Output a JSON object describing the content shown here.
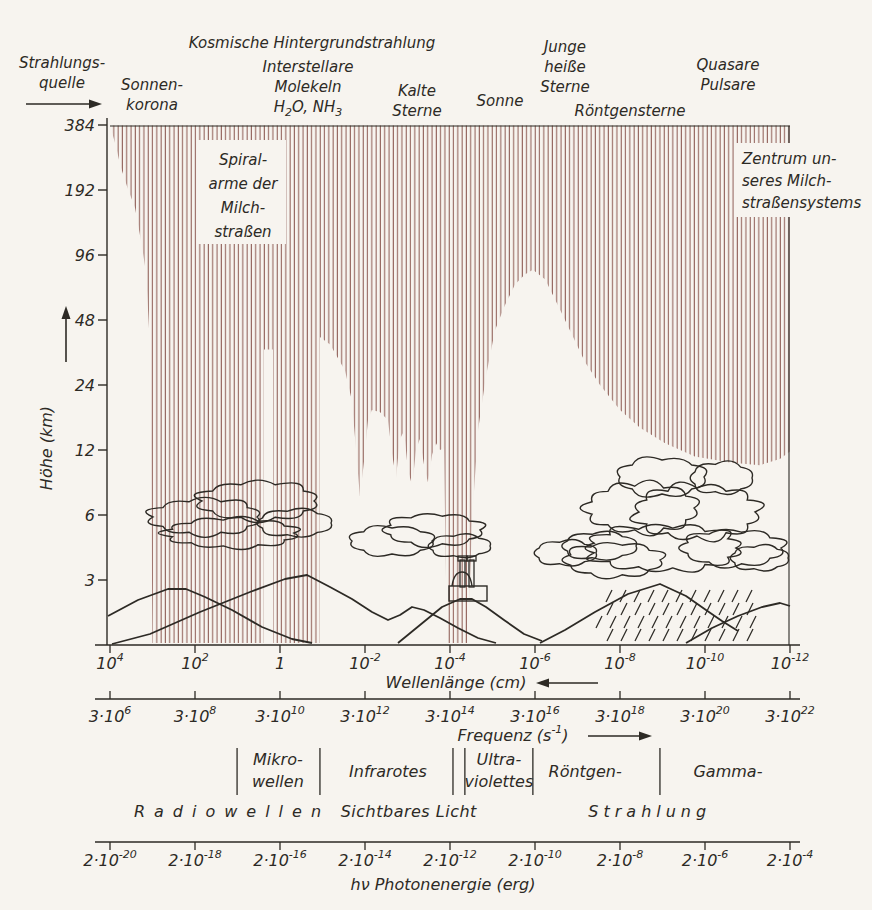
{
  "figure": {
    "width": 872,
    "height": 910,
    "colors": {
      "paper": "#f7f4ef",
      "ink": "#2d2a25",
      "hatch": "#8a564e"
    },
    "sources_heading": {
      "x": 62,
      "y": 68,
      "lines": [
        [
          {
            "t": "Strahlungs-"
          }
        ],
        [
          {
            "t": "quelle"
          }
        ]
      ],
      "arrow": {
        "x1": 26,
        "y1": 104,
        "x2": 102,
        "y2": 104
      }
    },
    "sources": [
      {
        "x": 152,
        "y": 90,
        "lines": [
          [
            {
              "t": "Sonnen-"
            }
          ],
          [
            {
              "t": "korona"
            }
          ]
        ]
      },
      {
        "x": 312,
        "y": 48,
        "lines": [
          [
            {
              "t": "Kosmische Hintergrundstrahlung"
            }
          ]
        ]
      },
      {
        "x": 308,
        "y": 72,
        "lines": [
          [
            {
              "t": "Interstellare"
            }
          ],
          [
            {
              "t": "Molekeln"
            }
          ],
          [
            {
              "t": "H"
            },
            {
              "t": "2",
              "sub": true
            },
            {
              "t": "O, NH"
            },
            {
              "t": "3",
              "sub": true
            }
          ]
        ]
      },
      {
        "x": 417,
        "y": 96,
        "lines": [
          [
            {
              "t": "Kalte"
            }
          ],
          [
            {
              "t": "Sterne"
            }
          ]
        ]
      },
      {
        "x": 500,
        "y": 106,
        "lines": [
          [
            {
              "t": "Sonne"
            }
          ]
        ]
      },
      {
        "x": 565,
        "y": 52,
        "lines": [
          [
            {
              "t": "Junge"
            }
          ],
          [
            {
              "t": "heiße"
            }
          ],
          [
            {
              "t": "Sterne"
            }
          ]
        ]
      },
      {
        "x": 630,
        "y": 116,
        "lines": [
          [
            {
              "t": "Röntgensterne"
            }
          ]
        ]
      },
      {
        "x": 728,
        "y": 70,
        "lines": [
          [
            {
              "t": "Quasare"
            }
          ],
          [
            {
              "t": "Pulsare"
            }
          ]
        ]
      }
    ],
    "annotations": [
      {
        "name": "spiral-arms",
        "anchor": "middle",
        "x": 243,
        "y": 165,
        "lh": 24,
        "box": [
          198,
          140,
          88,
          104
        ],
        "lines": [
          [
            {
              "t": "Spiral-"
            }
          ],
          [
            {
              "t": "arme der"
            }
          ],
          [
            {
              "t": "Milch-"
            }
          ],
          [
            {
              "t": "straßen"
            }
          ]
        ]
      },
      {
        "name": "galactic-center",
        "anchor": "start",
        "x": 742,
        "y": 164,
        "lh": 22,
        "box": [
          736,
          143,
          126,
          74
        ],
        "lines": [
          [
            {
              "t": "Zentrum un-"
            }
          ],
          [
            {
              "t": "seres Milch-"
            }
          ],
          [
            {
              "t": "straßensystems"
            }
          ]
        ]
      }
    ],
    "scenery": {
      "mountains": [
        [
          [
            108,
            616
          ],
          [
            138,
            600
          ],
          [
            168,
            589
          ],
          [
            186,
            589
          ],
          [
            205,
            597
          ],
          [
            232,
            610
          ],
          [
            262,
            627
          ],
          [
            292,
            639
          ],
          [
            312,
            643
          ]
        ],
        [
          [
            112,
            644
          ],
          [
            150,
            634
          ],
          [
            200,
            612
          ],
          [
            250,
            592
          ],
          [
            285,
            579
          ],
          [
            307,
            575
          ],
          [
            330,
            587
          ],
          [
            352,
            599
          ],
          [
            372,
            612
          ],
          [
            388,
            620
          ],
          [
            400,
            615
          ],
          [
            412,
            607
          ],
          [
            424,
            610
          ],
          [
            440,
            618
          ],
          [
            458,
            628
          ],
          [
            478,
            638
          ],
          [
            496,
            643
          ]
        ],
        [
          [
            398,
            643
          ],
          [
            420,
            625
          ],
          [
            442,
            607
          ],
          [
            460,
            599
          ],
          [
            472,
            599
          ],
          [
            486,
            607
          ],
          [
            504,
            620
          ],
          [
            524,
            634
          ],
          [
            542,
            641
          ]
        ],
        [
          [
            540,
            643
          ],
          [
            565,
            630
          ],
          [
            595,
            612
          ],
          [
            628,
            594
          ],
          [
            660,
            584
          ],
          [
            686,
            596
          ],
          [
            706,
            610
          ],
          [
            722,
            621
          ],
          [
            738,
            631
          ]
        ],
        [
          [
            686,
            643
          ],
          [
            712,
            628
          ],
          [
            738,
            616
          ],
          [
            762,
            607
          ],
          [
            780,
            603
          ],
          [
            790,
            606
          ]
        ]
      ],
      "clouds": [
        [
          205,
          517,
          52,
          16
        ],
        [
          258,
          501,
          56,
          17
        ],
        [
          232,
          533,
          62,
          13
        ],
        [
          295,
          523,
          36,
          12
        ],
        [
          392,
          541,
          40,
          13
        ],
        [
          434,
          530,
          46,
          14
        ],
        [
          460,
          546,
          30,
          10
        ],
        [
          566,
          553,
          30,
          11
        ],
        [
          600,
          546,
          36,
          12
        ],
        [
          614,
          560,
          46,
          15
        ],
        [
          664,
          548,
          72,
          20
        ],
        [
          642,
          508,
          52,
          22
        ],
        [
          697,
          512,
          58,
          24
        ],
        [
          662,
          477,
          42,
          17
        ],
        [
          722,
          478,
          30,
          14
        ],
        [
          733,
          548,
          48,
          16
        ],
        [
          760,
          558,
          28,
          11
        ]
      ],
      "rain": {
        "rows": [
          {
            "y": 590,
            "x1": 612,
            "x2": 752
          },
          {
            "y": 603,
            "x1": 606,
            "x2": 758
          },
          {
            "y": 616,
            "x1": 602,
            "x2": 762
          },
          {
            "y": 629,
            "x1": 606,
            "x2": 758
          }
        ],
        "step": 14,
        "dx": -6,
        "dy": 12
      },
      "observatory": {
        "base": [
          449,
          586,
          38,
          15
        ],
        "dome": [
          452,
          586,
          20,
          14
        ],
        "towers": [
          [
            460,
            560,
            5,
            27
          ],
          [
            469,
            560,
            5,
            27
          ]
        ],
        "caps": [
          [
            458,
            556,
            9,
            5
          ],
          [
            467,
            556,
            9,
            5
          ]
        ]
      }
    }
  },
  "chart_data": {
    "type": "area",
    "x_log_wavelength_range": [
      4,
      -12
    ],
    "height_axis": {
      "label": "Höhe (km)",
      "ticks": [
        384,
        192,
        96,
        48,
        24,
        12,
        6,
        3
      ]
    },
    "wavelength_axis": {
      "label_parts": [
        {
          "t": "Wellenlänge (cm)"
        }
      ],
      "arrow": "left",
      "ticks": [
        {
          "m": "10",
          "e": "4"
        },
        {
          "m": "10",
          "e": "2"
        },
        {
          "m": "1",
          "e": ""
        },
        {
          "m": "10",
          "e": "-2"
        },
        {
          "m": "10",
          "e": "-4"
        },
        {
          "m": "10",
          "e": "-6"
        },
        {
          "m": "10",
          "e": "-8"
        },
        {
          "m": "10",
          "e": "-10"
        },
        {
          "m": "10",
          "e": "-12"
        }
      ]
    },
    "frequency_axis": {
      "label_parts": [
        {
          "t": "Frequenz (s"
        },
        {
          "t": "-1",
          "sup": true
        },
        {
          "t": ")"
        }
      ],
      "arrow": "right",
      "ticks": [
        {
          "m": "3·10",
          "e": "6"
        },
        {
          "m": "3·10",
          "e": "8"
        },
        {
          "m": "3·10",
          "e": "10"
        },
        {
          "m": "3·10",
          "e": "12"
        },
        {
          "m": "3·10",
          "e": "14"
        },
        {
          "m": "3·10",
          "e": "16"
        },
        {
          "m": "3·10",
          "e": "18"
        },
        {
          "m": "3·10",
          "e": "20"
        },
        {
          "m": "3·10",
          "e": "22"
        }
      ]
    },
    "photon_axis": {
      "label_parts": [
        {
          "t": "hν Photonenergie (erg)"
        }
      ],
      "ticks": [
        {
          "m": "2·10",
          "e": "-20"
        },
        {
          "m": "2·10",
          "e": "-18"
        },
        {
          "m": "2·10",
          "e": "-16"
        },
        {
          "m": "2·10",
          "e": "-14"
        },
        {
          "m": "2·10",
          "e": "-12"
        },
        {
          "m": "2·10",
          "e": "-10"
        },
        {
          "m": "2·10",
          "e": "-8"
        },
        {
          "m": "2·10",
          "e": "-6"
        },
        {
          "m": "2·10",
          "e": "-4"
        }
      ]
    },
    "absorption_envelope": [
      [
        4.0,
        384
      ],
      [
        3.85,
        300
      ],
      [
        3.76,
        250
      ],
      [
        3.6,
        200
      ],
      [
        3.41,
        158
      ],
      [
        3.25,
        106
      ],
      [
        3.15,
        79
      ],
      [
        3.08,
        43
      ],
      [
        3.04,
        16
      ],
      [
        3.0,
        0
      ],
      [
        0.38,
        0
      ],
      [
        0.38,
        35
      ],
      [
        0.165,
        35
      ],
      [
        0.165,
        0
      ],
      [
        -0.94,
        0
      ],
      [
        -0.94,
        40
      ],
      [
        -1.18,
        37
      ],
      [
        -1.53,
        28
      ],
      [
        -1.69,
        20.4
      ],
      [
        -1.79,
        12
      ],
      [
        -1.88,
        7.3
      ],
      [
        -1.98,
        10.7
      ],
      [
        -2.07,
        16.5
      ],
      [
        -2.16,
        18.4
      ],
      [
        -2.35,
        18
      ],
      [
        -2.54,
        16.5
      ],
      [
        -2.64,
        11.4
      ],
      [
        -2.73,
        8.9
      ],
      [
        -2.82,
        13.5
      ],
      [
        -2.92,
        14.7
      ],
      [
        -3.01,
        9.7
      ],
      [
        -3.11,
        8.2
      ],
      [
        -3.2,
        12
      ],
      [
        -3.29,
        13.5
      ],
      [
        -3.39,
        10.2
      ],
      [
        -3.48,
        8.5
      ],
      [
        -3.58,
        11.4
      ],
      [
        -3.67,
        12.9
      ],
      [
        -3.76,
        12
      ],
      [
        -3.86,
        12.2
      ],
      [
        -3.93,
        0
      ],
      [
        -4.42,
        0
      ],
      [
        -4.52,
        5.7
      ],
      [
        -4.66,
        14.9
      ],
      [
        -4.85,
        26.6
      ],
      [
        -5.06,
        43
      ],
      [
        -5.29,
        56
      ],
      [
        -5.53,
        70
      ],
      [
        -5.76,
        78
      ],
      [
        -5.95,
        82
      ],
      [
        -6.24,
        74
      ],
      [
        -6.54,
        56
      ],
      [
        -6.82,
        43
      ],
      [
        -7.18,
        30.6
      ],
      [
        -7.53,
        24
      ],
      [
        -8.0,
        18.4
      ],
      [
        -8.47,
        15.2
      ],
      [
        -9.06,
        12.9
      ],
      [
        -9.76,
        11.2
      ],
      [
        -10.59,
        10.5
      ],
      [
        -11.29,
        10.2
      ],
      [
        -11.76,
        10.9
      ],
      [
        -12.0,
        11.8
      ]
    ],
    "bands": {
      "dividers_log": [
        1.01,
        -0.94,
        -4.07,
        -4.35,
        -5.95,
        -8.94
      ],
      "row1": [
        {
          "log": 0.05,
          "lines": [
            "Mikro-",
            "wellen"
          ]
        },
        {
          "log": -2.54,
          "lines": [
            "Infrarotes"
          ]
        },
        {
          "log": -5.15,
          "lines": [
            "Ultra-",
            "violettes"
          ]
        },
        {
          "log": -7.18,
          "lines": [
            "Röntgen-"
          ]
        },
        {
          "log": -10.54,
          "lines": [
            "Gamma-"
          ]
        }
      ],
      "row2": [
        {
          "log": 1.13,
          "text": "Radiowellen",
          "ls": 9
        },
        {
          "log": -3.03,
          "text": "Sichtbares Licht",
          "ls": 0.5
        },
        {
          "log": -8.7,
          "text": "Strahlung",
          "ls": 5
        }
      ]
    }
  }
}
